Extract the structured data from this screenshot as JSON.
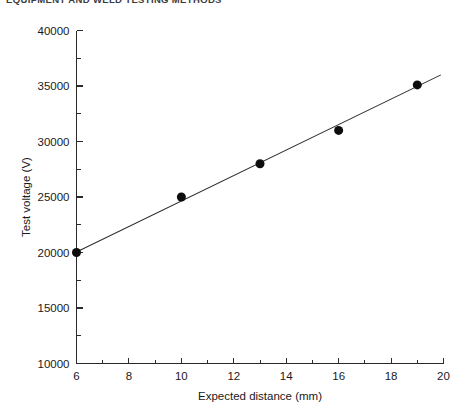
{
  "page_header": {
    "running_head": "EQUIPMENT AND WELD TESTING METHODS",
    "page_number": ""
  },
  "chart_data": {
    "type": "scatter",
    "title": "",
    "subtitle": "",
    "xlabel": "Expected distance (mm)",
    "ylabel": "Test voltage (V)",
    "xlim": [
      6,
      20
    ],
    "ylim": [
      10000,
      40000
    ],
    "x_major_ticks": [
      6,
      8,
      10,
      12,
      14,
      16,
      18,
      20
    ],
    "x_major_tick_labels": [
      "6",
      "8",
      "10",
      "12",
      "14",
      "16",
      "18",
      "20"
    ],
    "x_minor_ticks": [
      7,
      9,
      11,
      13,
      15,
      17,
      19
    ],
    "y_major_ticks": [
      10000,
      15000,
      20000,
      25000,
      30000,
      35000,
      40000
    ],
    "y_major_tick_labels": [
      "10000",
      "15000",
      "20000",
      "25000",
      "30000",
      "35000",
      "40000"
    ],
    "y_minor_ticks": [
      12500,
      17500,
      22500,
      27500,
      32500,
      37500
    ],
    "grid": false,
    "legend": false,
    "legend_position": "none",
    "marker_style": "filled-circle",
    "marker_color": "#0d0d0d",
    "marker_size_px": 9,
    "line_color": "#2d2d2d",
    "axis_color": "#2a2a2a",
    "background_color": "#ffffff",
    "x": [
      6,
      10,
      13,
      16,
      19
    ],
    "y": [
      20000,
      25000,
      28000,
      31000,
      35100
    ],
    "points": [
      {
        "x": 6,
        "y": 20000
      },
      {
        "x": 10,
        "y": 25000
      },
      {
        "x": 13,
        "y": 28000
      },
      {
        "x": 16,
        "y": 31000
      },
      {
        "x": 19,
        "y": 35100
      }
    ],
    "series": [
      {
        "name": "Test voltage vs expected distance",
        "x": [
          6,
          10,
          13,
          16,
          19
        ],
        "values": [
          20000,
          25000,
          28000,
          31000,
          35100
        ]
      }
    ],
    "fit_line": {
      "type": "linear",
      "x_start": 6,
      "x_end": 19.9,
      "y_start": 20050,
      "y_end": 36000
    },
    "annotations": []
  }
}
